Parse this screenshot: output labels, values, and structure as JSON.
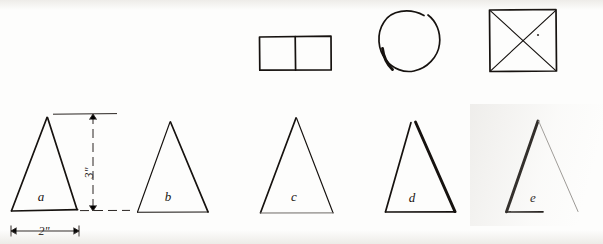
{
  "figure": {
    "background_color": "#fdfdfc",
    "ink_color": "#16120f",
    "width": 603,
    "height": 244
  },
  "top_row": {
    "shapes": [
      {
        "id": "divided-rectangle",
        "name": "rectangle-divided-in-two",
        "type": "rectangle",
        "description": "Rectangle split by a vertical median into two squares",
        "x": 259,
        "y": 36,
        "width": 72,
        "height": 34
      },
      {
        "id": "open-circle",
        "name": "open-circle",
        "type": "circle",
        "description": "Freehand circle left open at the upper right with a short tail at lower left",
        "cx": 410,
        "cy": 41,
        "r": 30
      },
      {
        "id": "square-with-diagonals",
        "name": "square-with-diagonals",
        "type": "square",
        "description": "Square with both diagonals drawn forming an X",
        "x": 489,
        "y": 9,
        "width": 67,
        "height": 62
      }
    ]
  },
  "bottom_row": {
    "caption": "Five hand-drawn isosceles triangles labelled a through e",
    "triangles": [
      {
        "id": "triangle-a",
        "label": "a",
        "label_x": 41,
        "label_y": 201,
        "apex_x": 47,
        "apex_y": 117,
        "base_left_x": 11,
        "base_left_y": 211,
        "base_right_x": 77,
        "base_right_y": 209,
        "line_weight": "medium",
        "base_drawn": true,
        "note": "Reference triangle carrying the dimensions"
      },
      {
        "id": "triangle-b",
        "label": "b",
        "label_x": 168,
        "label_y": 201,
        "apex_x": 170,
        "apex_y": 122,
        "base_left_x": 137,
        "base_left_y": 212,
        "base_right_x": 208,
        "base_right_y": 212,
        "line_weight": "thin",
        "base_drawn": true
      },
      {
        "id": "triangle-c",
        "label": "c",
        "label_x": 294,
        "label_y": 201,
        "apex_x": 296,
        "apex_y": 118,
        "base_left_x": 260,
        "base_left_y": 213,
        "base_right_x": 333,
        "base_right_y": 213,
        "line_weight": "thin",
        "base_drawn": true,
        "note": "Base line drawn faintly"
      },
      {
        "id": "triangle-d",
        "label": "d",
        "label_x": 412,
        "label_y": 202,
        "apex_x": 414,
        "apex_y": 122,
        "base_left_x": 385,
        "base_left_y": 212,
        "base_right_x": 455,
        "base_right_y": 212,
        "line_weight": "heavy",
        "base_drawn": true,
        "note": "Apex split; right side drawn with a heavy stroke"
      },
      {
        "id": "triangle-e",
        "label": "e",
        "label_x": 533,
        "label_y": 202,
        "apex_x": 538,
        "apex_y": 121,
        "base_left_x": 506,
        "base_left_y": 212,
        "base_right_x": 578,
        "base_right_y": 212,
        "line_weight": "heavy",
        "base_drawn": false,
        "note": "Left side heavy, right side faint, base omitted"
      }
    ]
  },
  "dimensions": [
    {
      "id": "height-dimension",
      "name": "vertical-height-dimension",
      "value": "3\"",
      "orientation": "vertical",
      "label_x": 93,
      "label_y": 173,
      "line_x": 93,
      "line_top": 117,
      "line_bottom": 211,
      "style": "dashed with arrowheads",
      "extension_top_y": 114,
      "extension_bottom_y": 211
    },
    {
      "id": "base-dimension",
      "name": "horizontal-base-dimension",
      "value": "2\"",
      "orientation": "horizontal",
      "label_x": 44,
      "label_y": 235,
      "line_y": 231,
      "line_left": 11,
      "line_right": 79,
      "style": "solid with arrowheads"
    }
  ]
}
